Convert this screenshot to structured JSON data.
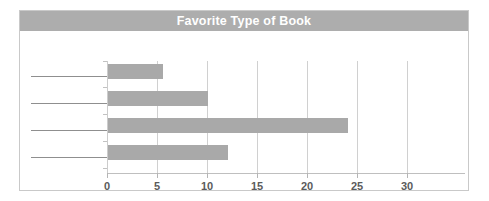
{
  "chart_data": {
    "type": "bar",
    "orientation": "horizontal",
    "title": "Favorite Type of Book",
    "xlabel": "",
    "ylabel": "",
    "categories": [
      "",
      "",
      "",
      ""
    ],
    "category_labels_blank": true,
    "values": [
      5.5,
      10,
      24,
      12
    ],
    "xlim": [
      0,
      34
    ],
    "xticks": [
      0,
      5,
      10,
      15,
      20,
      25,
      30
    ],
    "xtick_labels": [
      "0",
      "5",
      "10",
      "15",
      "20",
      "25",
      "30"
    ],
    "grid": "vertical",
    "legend": "none",
    "colors": {
      "bar": "#a9a9a9",
      "title_band": "#adadad",
      "title_text": "#ffffff",
      "gridline": "#d0d0d0",
      "axis": "#bfbfbf",
      "tick_label": "#5b5b5b",
      "card_border": "#c9c9c9",
      "answer_line": "#8f8f8f"
    }
  }
}
